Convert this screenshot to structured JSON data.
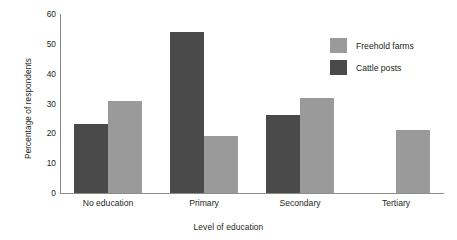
{
  "chart_data": {
    "type": "bar",
    "title": "",
    "subtitle": "",
    "xlabel": "Level of education",
    "ylabel": "Percentage of respondents",
    "categories": [
      "No education",
      "Primary",
      "Secondary",
      "Tertiary"
    ],
    "series": [
      {
        "name": "Cattle posts",
        "color": "#4a4a4a",
        "values": [
          23,
          54,
          26,
          null
        ]
      },
      {
        "name": "Freehold farms",
        "color": "#9a9a9a",
        "values": [
          31,
          19,
          32,
          21
        ]
      }
    ],
    "ylim": [
      0,
      60
    ],
    "yticks": [
      0,
      10,
      20,
      30,
      40,
      50,
      60
    ],
    "ytick_labels": [
      "0",
      "10",
      "20",
      "30",
      "40",
      "50",
      "60"
    ],
    "grid": false,
    "legend_position": "upper-right",
    "legend_order": [
      "Freehold farms",
      "Cattle posts"
    ]
  },
  "legend": {
    "entries": [
      {
        "label": "Freehold farms",
        "tone": "light"
      },
      {
        "label": "Cattle posts",
        "tone": "dark"
      }
    ]
  },
  "colors": {
    "series_dark": "#4a4a4a",
    "series_light": "#9a9a9a",
    "axis": "#8b8b8b",
    "text": "#231f20",
    "background": "#ffffff"
  }
}
